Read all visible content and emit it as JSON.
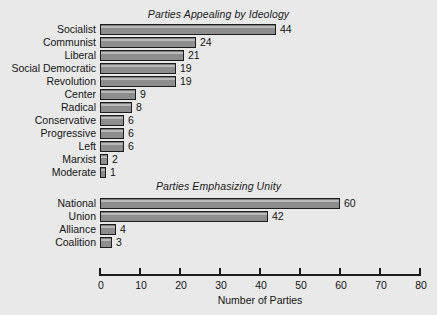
{
  "chart_data": [
    {
      "type": "bar",
      "orientation": "horizontal",
      "title": "Parties Appealing by Ideology",
      "categories": [
        "Socialist",
        "Communist",
        "Liberal",
        "Social Democratic",
        "Revolution",
        "Center",
        "Radical",
        "Conservative",
        "Progressive",
        "Left",
        "Marxist",
        "Moderate"
      ],
      "values": [
        44,
        24,
        21,
        19,
        19,
        9,
        8,
        6,
        6,
        6,
        2,
        1
      ],
      "xlabel": "Number of Parties",
      "ylabel": "",
      "xlim": [
        0,
        80
      ],
      "grid": false,
      "legend": false,
      "bar_color": "#8d8d8d",
      "bar_edge_color": "#1c1c1c"
    },
    {
      "type": "bar",
      "orientation": "horizontal",
      "title": "Parties Emphasizing Unity",
      "categories": [
        "National",
        "Union",
        "Alliance",
        "Coalition"
      ],
      "values": [
        60,
        42,
        4,
        3
      ],
      "xlabel": "Number of Parties",
      "ylabel": "",
      "xlim": [
        0,
        80
      ],
      "grid": false,
      "legend": false,
      "bar_color": "#8d8d8d",
      "bar_edge_color": "#1c1c1c"
    }
  ],
  "axis": {
    "label": "Number of Parties",
    "ticks": [
      "0",
      "10",
      "20",
      "30",
      "40",
      "50",
      "60",
      "70",
      "80"
    ],
    "tick_values": [
      0,
      10,
      20,
      30,
      40,
      50,
      60,
      70,
      80
    ]
  },
  "panel_top": {
    "title": "Parties Appealing by Ideology",
    "rows": [
      {
        "label": "Socialist",
        "value": "44"
      },
      {
        "label": "Communist",
        "value": "24"
      },
      {
        "label": "Liberal",
        "value": "21"
      },
      {
        "label": "Social Democratic",
        "value": "19"
      },
      {
        "label": "Revolution",
        "value": "19"
      },
      {
        "label": "Center",
        "value": "9"
      },
      {
        "label": "Radical",
        "value": "8"
      },
      {
        "label": "Conservative",
        "value": "6"
      },
      {
        "label": "Progressive",
        "value": "6"
      },
      {
        "label": "Left",
        "value": "6"
      },
      {
        "label": "Marxist",
        "value": "2"
      },
      {
        "label": "Moderate",
        "value": "1"
      }
    ]
  },
  "panel_bottom": {
    "title": "Parties Emphasizing Unity",
    "rows": [
      {
        "label": "National",
        "value": "60"
      },
      {
        "label": "Union",
        "value": "42"
      },
      {
        "label": "Alliance",
        "value": "4"
      },
      {
        "label": "Coalition",
        "value": "3"
      }
    ]
  },
  "colors": {
    "background": "#e9e9e9",
    "bar_fill": "#8d8d8d",
    "bar_edge": "#1c1c1c",
    "text": "#141414"
  }
}
